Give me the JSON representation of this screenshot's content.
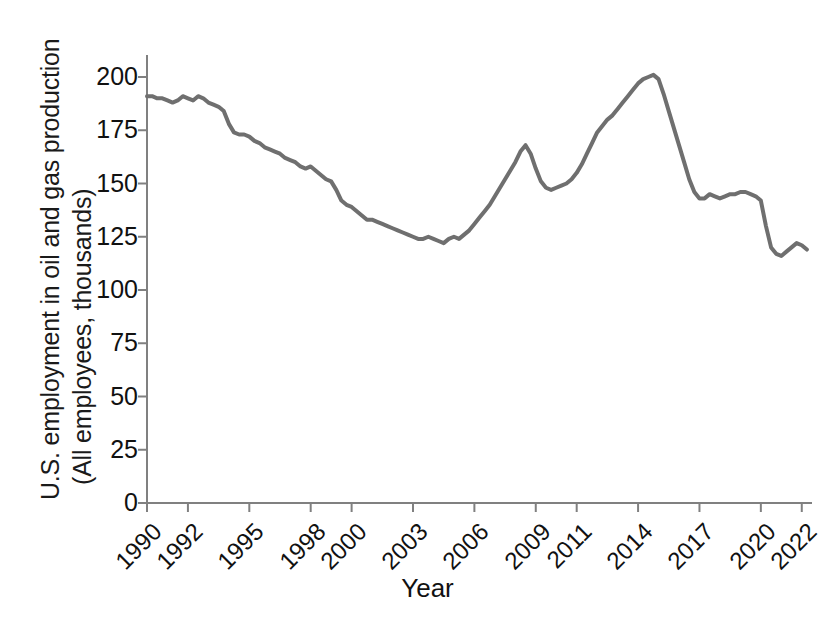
{
  "chart_data": {
    "type": "line",
    "title": "",
    "xlabel": "Year",
    "ylabel_line1": "U.S. employment in oil and gas production",
    "ylabel_line2": "(All employees, thousands)",
    "series_name": "All employees, oil and gas extraction",
    "line_color": "#6f6f6f",
    "axis_color": "#808080",
    "grid": false,
    "legend": "none",
    "ylim": [
      0,
      210
    ],
    "yticks": [
      0,
      25,
      50,
      75,
      100,
      125,
      150,
      175,
      200
    ],
    "ytick_labels": [
      "0",
      "25",
      "50",
      "75",
      "100",
      "125",
      "150",
      "175",
      "200"
    ],
    "xlim": [
      1990,
      2022.5
    ],
    "xticks": [
      1990,
      1992,
      1995,
      1998,
      2000,
      2003,
      2006,
      2009,
      2011,
      2014,
      2017,
      2020,
      2022
    ],
    "xtick_labels": [
      "1990",
      "1992",
      "1995",
      "1998",
      "2000",
      "2003",
      "2006",
      "2009",
      "2011",
      "2014",
      "2017",
      "2020",
      "2022"
    ],
    "x": [
      1990.0,
      1990.25,
      1990.5,
      1990.75,
      1991.0,
      1991.25,
      1991.5,
      1991.75,
      1992.0,
      1992.25,
      1992.5,
      1992.75,
      1993.0,
      1993.25,
      1993.5,
      1993.75,
      1994.0,
      1994.25,
      1994.5,
      1994.75,
      1995.0,
      1995.25,
      1995.5,
      1995.75,
      1996.0,
      1996.25,
      1996.5,
      1996.75,
      1997.0,
      1997.25,
      1997.5,
      1997.75,
      1998.0,
      1998.25,
      1998.5,
      1998.75,
      1999.0,
      1999.25,
      1999.5,
      1999.75,
      2000.0,
      2000.25,
      2000.5,
      2000.75,
      2001.0,
      2001.25,
      2001.5,
      2001.75,
      2002.0,
      2002.25,
      2002.5,
      2002.75,
      2003.0,
      2003.25,
      2003.5,
      2003.75,
      2004.0,
      2004.25,
      2004.5,
      2004.75,
      2005.0,
      2005.25,
      2005.5,
      2005.75,
      2006.0,
      2006.25,
      2006.5,
      2006.75,
      2007.0,
      2007.25,
      2007.5,
      2007.75,
      2008.0,
      2008.25,
      2008.5,
      2008.75,
      2009.0,
      2009.25,
      2009.5,
      2009.75,
      2010.0,
      2010.25,
      2010.5,
      2010.75,
      2011.0,
      2011.25,
      2011.5,
      2011.75,
      2012.0,
      2012.25,
      2012.5,
      2012.75,
      2013.0,
      2013.25,
      2013.5,
      2013.75,
      2014.0,
      2014.25,
      2014.5,
      2014.75,
      2015.0,
      2015.25,
      2015.5,
      2015.75,
      2016.0,
      2016.25,
      2016.5,
      2016.75,
      2017.0,
      2017.25,
      2017.5,
      2017.75,
      2018.0,
      2018.25,
      2018.5,
      2018.75,
      2019.0,
      2019.25,
      2019.5,
      2019.75,
      2020.0,
      2020.25,
      2020.5,
      2020.75,
      2021.0,
      2021.25,
      2021.5,
      2021.75,
      2022.0,
      2022.25
    ],
    "values": [
      191,
      191,
      190,
      190,
      189,
      188,
      189,
      191,
      190,
      189,
      191,
      190,
      188,
      187,
      186,
      184,
      178,
      174,
      173,
      173,
      172,
      170,
      169,
      167,
      166,
      165,
      164,
      162,
      161,
      160,
      158,
      157,
      158,
      156,
      154,
      152,
      151,
      147,
      142,
      140,
      139,
      137,
      135,
      133,
      133,
      132,
      131,
      130,
      129,
      128,
      127,
      126,
      125,
      124,
      124,
      125,
      124,
      123,
      122,
      124,
      125,
      124,
      126,
      128,
      131,
      134,
      137,
      140,
      144,
      148,
      152,
      156,
      160,
      165,
      168,
      164,
      157,
      151,
      148,
      147,
      148,
      149,
      150,
      152,
      155,
      159,
      164,
      169,
      174,
      177,
      180,
      182,
      185,
      188,
      191,
      194,
      197,
      199,
      200,
      201,
      199,
      192,
      184,
      176,
      168,
      160,
      152,
      146,
      143,
      143,
      145,
      144,
      143,
      144,
      145,
      145,
      146,
      146,
      145,
      144,
      142,
      130,
      120,
      117,
      116,
      118,
      120,
      122,
      121,
      119
    ],
    "key_points": [
      {
        "year": 1990,
        "value": 191,
        "note": "start"
      },
      {
        "year": 1992,
        "value": 190,
        "note": "local high"
      },
      {
        "year": 2003,
        "value": 120,
        "note": "trough"
      },
      {
        "year": 2008.5,
        "value": 168,
        "note": "pre-recession peak"
      },
      {
        "year": 2009.75,
        "value": 147,
        "note": "recession dip"
      },
      {
        "year": 2014.75,
        "value": 201,
        "note": "all-time peak"
      },
      {
        "year": 2017,
        "value": 143,
        "note": "post-bust level"
      },
      {
        "year": 2020.75,
        "value": 116,
        "note": "pandemic trough"
      },
      {
        "year": 2022.25,
        "value": 119,
        "note": "end"
      }
    ]
  },
  "axes": {
    "plot_left_px": 147,
    "plot_right_px": 812,
    "plot_bottom_px": 503,
    "plot_top_px": 55
  }
}
